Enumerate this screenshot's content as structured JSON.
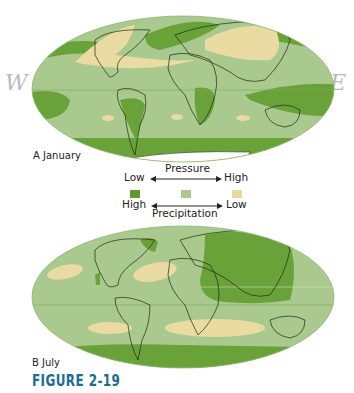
{
  "figure": {
    "number_label": "FIGURE 2-19",
    "panel_a_label": "A  January",
    "panel_b_label": "B  July",
    "handwritten_left": "W",
    "handwritten_right": "E"
  },
  "legend": {
    "pressure_title": "Pressure",
    "precip_title": "Precipitation",
    "pressure_low": "Low",
    "pressure_high": "High",
    "precip_high": "High",
    "precip_low": "Low",
    "colors": {
      "low_pressure_high_precip": "#5f9a2e",
      "moderate": "#a9c98f",
      "high_pressure_low_precip": "#e8d9a0"
    }
  },
  "colors": {
    "base": "#a9c98f",
    "dark": "#6aa23a",
    "tan": "#eadba2",
    "ice": "#ffffff",
    "coast": "#1e2a14",
    "figure_label": "#1a6c96"
  }
}
